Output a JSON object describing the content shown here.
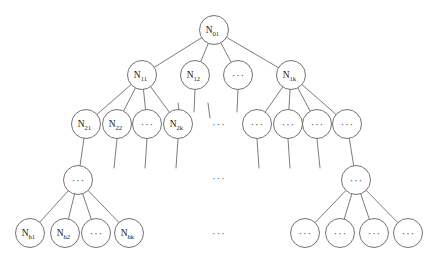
{
  "diagram": {
    "type": "tree",
    "title": "",
    "background_color": "#ffffff",
    "stroke_color": "#5a5a5a",
    "node_fill_color": "#ffffff",
    "label_color": "#1a1a1a",
    "ellipsis_glyph": "···",
    "node_radius": 14.5,
    "levels": [
      {
        "index": 0,
        "y": 30,
        "nodes": [
          {
            "id": "n01",
            "x": 214,
            "y": 30,
            "base": "N",
            "sub": "01",
            "kind": "labeled"
          }
        ]
      },
      {
        "index": 1,
        "y": 75,
        "nodes": [
          {
            "id": "n11",
            "x": 142,
            "y": 75,
            "base": "N",
            "sub": "11",
            "kind": "labeled"
          },
          {
            "id": "n12",
            "x": 195,
            "y": 75,
            "base": "N",
            "sub": "12",
            "kind": "labeled"
          },
          {
            "id": "n1dots",
            "x": 238,
            "y": 75,
            "base": "",
            "sub": "",
            "kind": "ellipsis"
          },
          {
            "id": "n1k",
            "x": 291,
            "y": 75,
            "base": "N",
            "sub": "1k",
            "kind": "labeled"
          }
        ]
      },
      {
        "index": 2,
        "y": 124,
        "nodes": [
          {
            "id": "n21",
            "x": 86,
            "y": 124,
            "base": "N",
            "sub": "21",
            "kind": "labeled"
          },
          {
            "id": "n22",
            "x": 117,
            "y": 124,
            "base": "N",
            "sub": "22",
            "kind": "labeled"
          },
          {
            "id": "n2dots",
            "x": 147,
            "y": 124,
            "base": "",
            "sub": "",
            "kind": "ellipsis"
          },
          {
            "id": "n2k",
            "x": 178,
            "y": 124,
            "base": "N",
            "sub": "2k",
            "kind": "labeled"
          },
          {
            "id": "n2r1",
            "x": 257,
            "y": 124,
            "base": "",
            "sub": "",
            "kind": "ellipsis"
          },
          {
            "id": "n2r2",
            "x": 288,
            "y": 124,
            "base": "",
            "sub": "",
            "kind": "ellipsis"
          },
          {
            "id": "n2r3",
            "x": 317,
            "y": 124,
            "base": "",
            "sub": "",
            "kind": "ellipsis"
          },
          {
            "id": "n2r4",
            "x": 347,
            "y": 124,
            "base": "",
            "sub": "",
            "kind": "ellipsis"
          }
        ]
      },
      {
        "index": 3,
        "y": 180,
        "nodes": [
          {
            "id": "n3l",
            "x": 78,
            "y": 180,
            "base": "",
            "sub": "",
            "kind": "ellipsis"
          },
          {
            "id": "n3r",
            "x": 356,
            "y": 180,
            "base": "",
            "sub": "",
            "kind": "ellipsis"
          }
        ]
      },
      {
        "index": 4,
        "y": 233,
        "nodes": [
          {
            "id": "nh1",
            "x": 30,
            "y": 233,
            "base": "N",
            "sub": "h1",
            "kind": "labeled"
          },
          {
            "id": "nh2",
            "x": 65,
            "y": 233,
            "base": "N",
            "sub": "h2",
            "kind": "labeled"
          },
          {
            "id": "nhdots",
            "x": 96,
            "y": 233,
            "base": "",
            "sub": "",
            "kind": "ellipsis"
          },
          {
            "id": "nhk",
            "x": 129,
            "y": 233,
            "base": "N",
            "sub": "hk",
            "kind": "labeled"
          },
          {
            "id": "nhr1",
            "x": 305,
            "y": 233,
            "base": "",
            "sub": "",
            "kind": "ellipsis"
          },
          {
            "id": "nhr2",
            "x": 340,
            "y": 233,
            "base": "",
            "sub": "",
            "kind": "ellipsis"
          },
          {
            "id": "nhr3",
            "x": 374,
            "y": 233,
            "base": "",
            "sub": "",
            "kind": "ellipsis"
          },
          {
            "id": "nhr4",
            "x": 408,
            "y": 233,
            "base": "",
            "sub": "",
            "kind": "ellipsis"
          }
        ]
      }
    ],
    "edges": [
      {
        "from": "n01",
        "to": "n11"
      },
      {
        "from": "n01",
        "to": "n12"
      },
      {
        "from": "n01",
        "to": "n1dots"
      },
      {
        "from": "n01",
        "to": "n1k"
      },
      {
        "from": "n11",
        "to": "n21"
      },
      {
        "from": "n11",
        "to": "n22"
      },
      {
        "from": "n11",
        "to": "n2dots"
      },
      {
        "from": "n11",
        "to": "n2k"
      },
      {
        "from": "n1k",
        "to": "n2r1"
      },
      {
        "from": "n1k",
        "to": "n2r2"
      },
      {
        "from": "n1k",
        "to": "n2r3"
      },
      {
        "from": "n1k",
        "to": "n2r4"
      },
      {
        "from": "n21",
        "to": "n3l"
      },
      {
        "from": "n2r4",
        "to": "n3r"
      },
      {
        "from": "n3l",
        "to": "nh1"
      },
      {
        "from": "n3l",
        "to": "nh2"
      },
      {
        "from": "n3l",
        "to": "nhdots"
      },
      {
        "from": "n3l",
        "to": "nhk"
      },
      {
        "from": "n3r",
        "to": "nhr1"
      },
      {
        "from": "n3r",
        "to": "nhr2"
      },
      {
        "from": "n3r",
        "to": "nhr3"
      },
      {
        "from": "n3r",
        "to": "nhr4"
      }
    ],
    "stub_edges": [
      {
        "id": "stub-n12",
        "x1": 195,
        "y1": 90,
        "x2": 194,
        "y2": 112
      },
      {
        "id": "stub-n1dots",
        "x1": 238,
        "y1": 90,
        "x2": 237,
        "y2": 112
      },
      {
        "id": "stub-n22",
        "x1": 117,
        "y1": 139,
        "x2": 114,
        "y2": 168
      },
      {
        "id": "stub-n2dots",
        "x1": 147,
        "y1": 139,
        "x2": 145,
        "y2": 168
      },
      {
        "id": "stub-n2k",
        "x1": 178,
        "y1": 139,
        "x2": 176,
        "y2": 168
      },
      {
        "id": "stub-n2r1",
        "x1": 257,
        "y1": 139,
        "x2": 259,
        "y2": 168
      },
      {
        "id": "stub-n2r2",
        "x1": 288,
        "y1": 139,
        "x2": 290,
        "y2": 168
      },
      {
        "id": "stub-n2r3",
        "x1": 317,
        "y1": 139,
        "x2": 320,
        "y2": 168
      },
      {
        "id": "stub-left-upper",
        "x1": 178,
        "y1": 103,
        "x2": 180,
        "y2": 118
      },
      {
        "id": "stub-right-upper",
        "x1": 208,
        "y1": 103,
        "x2": 210,
        "y2": 118
      }
    ],
    "gap_markers": [
      {
        "id": "gap-level2",
        "x": 219,
        "y": 124,
        "text": "···"
      },
      {
        "id": "gap-level3",
        "x": 219,
        "y": 178,
        "text": "···"
      },
      {
        "id": "gap-level4",
        "x": 219,
        "y": 233,
        "text": "···"
      }
    ]
  }
}
